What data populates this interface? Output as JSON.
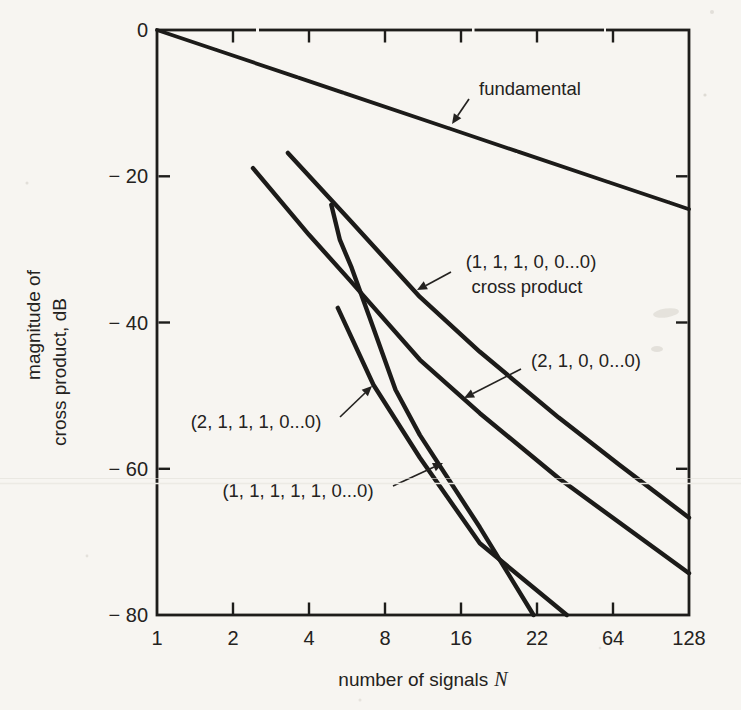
{
  "figure": {
    "background": "#f7f5f1",
    "ink": "#1c1b19"
  },
  "y_axis": {
    "title_line1": "magnitude of",
    "title_line2": "cross product, dB",
    "ticks": [
      {
        "label": "0",
        "value": 0
      },
      {
        "label": "− 20",
        "value": -20
      },
      {
        "label": "− 40",
        "value": -40
      },
      {
        "label": "− 60",
        "value": -60
      },
      {
        "label": "− 80",
        "value": -80
      }
    ]
  },
  "x_axis": {
    "title": "number of signals",
    "title_italic": "N",
    "ticks": [
      {
        "label": "1",
        "value": 1
      },
      {
        "label": "2",
        "value": 2
      },
      {
        "label": "4",
        "value": 4
      },
      {
        "label": "8",
        "value": 8
      },
      {
        "label": "16",
        "value": 16
      },
      {
        "label": "22",
        "value": 32
      },
      {
        "label": "64",
        "value": 64
      },
      {
        "label": "128",
        "value": 128
      }
    ]
  },
  "annotations": {
    "fundamental": {
      "text": "fundamental"
    },
    "cross_product_111": {
      "line1": "(1, 1, 1, 0, 0...0)",
      "line2": "cross product"
    },
    "cross_product_21": {
      "text": "(2, 1, 0, 0...0)"
    },
    "cross_product_2111": {
      "text": "(2, 1, 1, 1, 0...0)"
    },
    "cross_product_11111": {
      "text": "(1, 1, 1, 1, 1, 0...0)"
    }
  },
  "chart_data": {
    "type": "line",
    "title": "",
    "xlabel": "number of signals N",
    "ylabel": "magnitude of cross product, dB",
    "x_scale": "log2",
    "xlim": [
      1,
      128
    ],
    "ylim": [
      -80,
      0
    ],
    "grid": false,
    "legend": "inline-arrow-annotations",
    "x_tick_labels": [
      "1",
      "2",
      "4",
      "8",
      "16",
      "22",
      "64",
      "128"
    ],
    "y_tick_values": [
      0,
      -20,
      -40,
      -60,
      -80
    ],
    "series": [
      {
        "name": "fundamental",
        "points": [
          [
            1,
            0
          ],
          [
            128,
            -24.5
          ]
        ]
      },
      {
        "name": "(1, 1, 1, 0, 0...0) cross product",
        "points": [
          [
            3.3,
            -16.8
          ],
          [
            5.8,
            -26.0
          ],
          [
            11,
            -36.5
          ],
          [
            19,
            -44.0
          ],
          [
            39,
            -53.0
          ],
          [
            68,
            -59.5
          ],
          [
            128,
            -66.7
          ]
        ]
      },
      {
        "name": "(2, 1, 0, 0...0)",
        "points": [
          [
            2.4,
            -18.9
          ],
          [
            4.0,
            -28.0
          ],
          [
            5.8,
            -34.2
          ],
          [
            11,
            -45.1
          ],
          [
            19,
            -52.4
          ],
          [
            39,
            -61.3
          ],
          [
            128,
            -74.3
          ]
        ]
      },
      {
        "name": "(2, 1, 1, 1, 0...0)",
        "points": [
          [
            5.2,
            -38.0
          ],
          [
            7.2,
            -48.5
          ],
          [
            11,
            -58.5
          ],
          [
            19,
            -70.2
          ],
          [
            42,
            -80
          ]
        ]
      },
      {
        "name": "(1, 1, 1, 1, 1, 0...0)",
        "points": [
          [
            4.9,
            -23.9
          ],
          [
            5.3,
            -28.7
          ],
          [
            5.9,
            -32.5
          ],
          [
            6.9,
            -39.0
          ],
          [
            8.8,
            -49.2
          ],
          [
            11,
            -55.4
          ],
          [
            19,
            -68.0
          ],
          [
            31,
            -80
          ]
        ]
      }
    ]
  }
}
